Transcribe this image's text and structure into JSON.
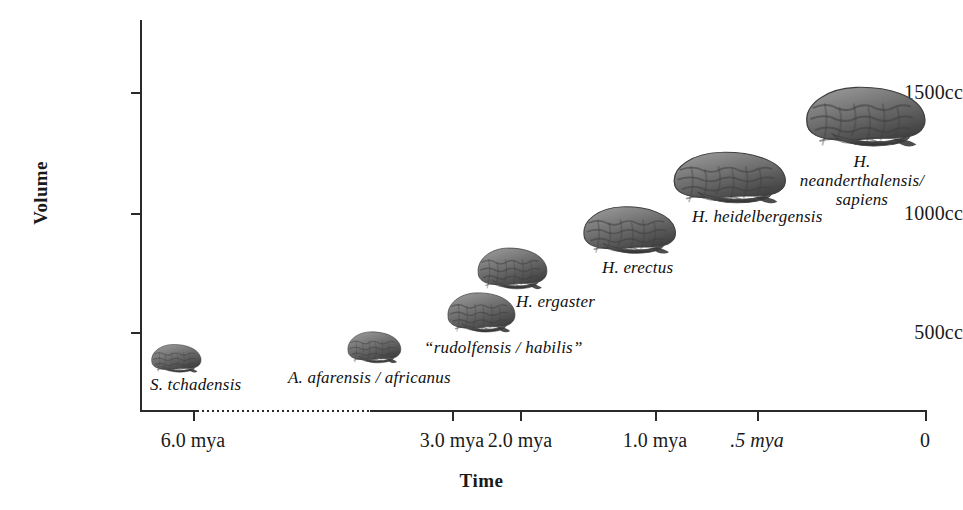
{
  "chart_data": {
    "type": "scatter",
    "title": "",
    "xlabel": "Time",
    "ylabel": "Volume",
    "xtick_labels": [
      "6.0 mya",
      "3.0 mya",
      "2.0 mya",
      "1.0 mya",
      ".5 mya",
      "0"
    ],
    "ytick_labels": [
      "1500cc",
      "1000cc",
      "500cc"
    ],
    "ytick_values": [
      1500,
      1000,
      500
    ],
    "ylim": [
      0,
      1750
    ],
    "grid": false,
    "legend": false,
    "axis_break_note": "dotted segment on time axis between 6.0 mya and 3.0 mya",
    "categories": [
      "S. tchadensis",
      "A. afarensis / africanus",
      "“rudolfensis / habilis”",
      "H. ergaster",
      "H. erectus",
      "H. heidelbergensis",
      "H. neanderthalensis/ sapiens"
    ],
    "x": [
      6.0,
      3.0,
      2.0,
      1.8,
      1.0,
      0.5,
      0.1
    ],
    "values": [
      360,
      450,
      600,
      800,
      950,
      1200,
      1400
    ]
  },
  "axes": {
    "y_title": "Volume",
    "x_title": "Time",
    "y_ticks": [
      {
        "label": "1500cc",
        "top": 82
      },
      {
        "label": "1000cc",
        "top": 203
      },
      {
        "label": "500cc",
        "top": 322
      }
    ],
    "x_ticks": [
      {
        "label": "6.0 mya",
        "left": 193,
        "italic": false
      },
      {
        "label": "3.0 mya",
        "left": 452,
        "italic": false
      },
      {
        "label": "2.0 mya",
        "left": 520,
        "italic": false
      },
      {
        "label": "1.0 mya",
        "left": 655,
        "italic": false
      },
      {
        "label": ".5 mya",
        "left": 757,
        "italic": true
      },
      {
        "label": "0",
        "left": 925,
        "italic": false
      }
    ]
  },
  "points": [
    {
      "id": "s-tchadensis",
      "label": "S. tchadensis",
      "brain": {
        "left": 148,
        "top": 341,
        "width": 56,
        "height": 34
      },
      "text": {
        "left": 150,
        "top": 375,
        "align": "left"
      }
    },
    {
      "id": "a-afarensis-africanus",
      "label": "A. afarensis / africanus",
      "brain": {
        "left": 344,
        "top": 328,
        "width": 60,
        "height": 38
      },
      "text": {
        "left": 288,
        "top": 368,
        "align": "left"
      }
    },
    {
      "id": "rudolfensis-habilis",
      "label": "“rudolfensis / habilis”",
      "brain": {
        "left": 443,
        "top": 288,
        "width": 76,
        "height": 48
      },
      "text": {
        "left": 424,
        "top": 338,
        "align": "left"
      }
    },
    {
      "id": "h-ergaster",
      "label": "H. ergaster",
      "brain": {
        "left": 473,
        "top": 243,
        "width": 78,
        "height": 50
      },
      "text": {
        "left": 516,
        "top": 292,
        "align": "left"
      }
    },
    {
      "id": "h-erectus",
      "label": "H. erectus",
      "brain": {
        "left": 577,
        "top": 201,
        "width": 104,
        "height": 57
      },
      "text": {
        "left": 602,
        "top": 258,
        "align": "left"
      }
    },
    {
      "id": "h-heidelbergensis",
      "label": "H. heidelbergensis",
      "brain": {
        "left": 666,
        "top": 146,
        "width": 126,
        "height": 62
      },
      "text": {
        "left": 692,
        "top": 207,
        "align": "left"
      }
    },
    {
      "id": "h-neanderthalensis-sapiens",
      "label": "H. neanderthalensis/\nsapiens",
      "brain": {
        "left": 798,
        "top": 80,
        "width": 134,
        "height": 72
      },
      "text": {
        "left": 862,
        "top": 152,
        "align": "center"
      }
    }
  ],
  "colors": {
    "axis": "#2a2a2a",
    "text": "#1a1a1a",
    "brain_light": "#9a9a9a",
    "brain_mid": "#6f6f6f",
    "brain_dark": "#3f3f3f",
    "background": "#ffffff"
  }
}
